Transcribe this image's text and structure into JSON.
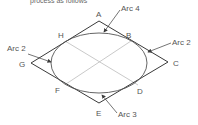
{
  "caption_partial": "process as follows",
  "points": {
    "A": "A",
    "B": "B",
    "C": "C",
    "D": "D",
    "E": "E",
    "F": "F",
    "G": "G",
    "H": "H"
  },
  "arcs": {
    "top": "Arc 4",
    "right": "Arc 2",
    "left": "Arc 2",
    "bottom": "Arc 3"
  },
  "colors": {
    "outline": "#3a3a3a",
    "ellipse": "#555555",
    "construction": "#bbbbbb",
    "text": "#555555"
  }
}
